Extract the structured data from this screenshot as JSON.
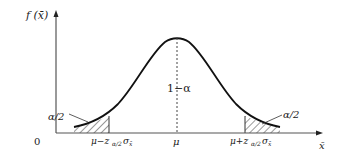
{
  "diagram": {
    "type": "normal-distribution-confidence-interval",
    "y_axis_label": "f (x̄)",
    "x_axis_label": "x̄",
    "origin_label": "0",
    "center_label": "μ",
    "center_region_label": "1−α",
    "left_tail_label": "α/2",
    "right_tail_label": "α/2",
    "left_bound_label": "μ−z",
    "left_bound_sub": "α/2",
    "left_bound_sigma": "σ",
    "left_bound_sigma_sub": "x̄",
    "right_bound_label": "μ+z",
    "right_bound_sub": "α/2",
    "right_bound_sigma": "σ",
    "right_bound_sigma_sub": "x̄"
  }
}
